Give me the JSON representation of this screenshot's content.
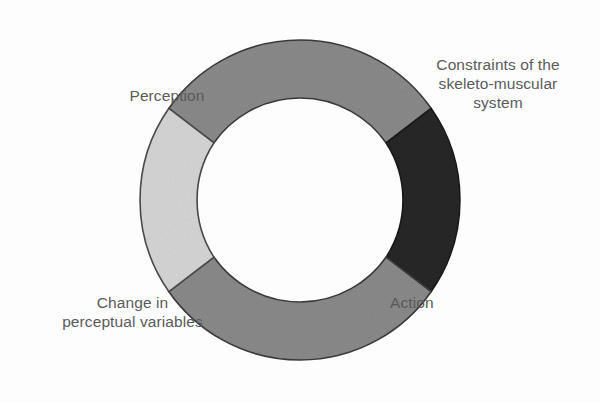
{
  "diagram": {
    "type": "cycle",
    "background_color": "#fdfdfd",
    "center": {
      "x": 300,
      "y": 200
    },
    "inner_radius": 105,
    "outer_radius": 160,
    "labels": {
      "perception": "Perception",
      "constraints": "Constraints of the\nskeleto-muscular\nsystem",
      "change": "Change in\nperceptual variables",
      "action": "Action"
    },
    "label_color": "#5a5a5a",
    "segments": [
      {
        "name": "top-segment",
        "position": "top",
        "fill": "#8a8a8a",
        "stroke": "#3a3a3a",
        "start_angle": -145,
        "end_angle": -35,
        "associated_label": "perception"
      },
      {
        "name": "right-segment",
        "position": "right",
        "fill": "#262626",
        "stroke": "#1a1a1a",
        "start_angle": -35,
        "end_angle": 35,
        "associated_label": "constraints"
      },
      {
        "name": "bottom-segment",
        "position": "bottom",
        "fill": "#8a8a8a",
        "stroke": "#3a3a3a",
        "start_angle": 35,
        "end_angle": 145,
        "associated_label": "action"
      },
      {
        "name": "left-segment",
        "position": "left",
        "fill": "#d5d5d5",
        "stroke": "#4a4a4a",
        "start_angle": 145,
        "end_angle": 215,
        "associated_label": "change"
      }
    ]
  }
}
